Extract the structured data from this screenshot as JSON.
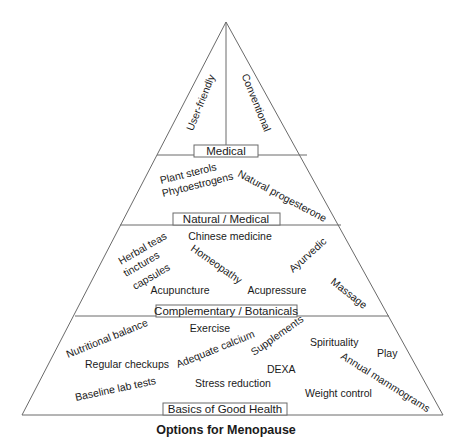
{
  "diagram": {
    "title": "Options for Menopause",
    "tiers": [
      {
        "name": "Medical",
        "items": [
          "User-friendly",
          "Conventional"
        ]
      },
      {
        "name": "Natural / Medical",
        "items": [
          "Plant sterols",
          "Phytoestrogens",
          "Natural progesterone"
        ]
      },
      {
        "name": "Complementary / Botanicals",
        "items": [
          "Chinese medicine",
          "Herbal teas",
          "tinctures",
          "capsules",
          "Homeopathy",
          "Ayurvedic",
          "Acupuncture",
          "Acupressure",
          "Massage"
        ]
      },
      {
        "name": "Basics of Good Health",
        "items": [
          "Nutritional balance",
          "Exercise",
          "Adequate calcium",
          "Supplements",
          "Spirituality",
          "Play",
          "Regular checkups",
          "DEXA",
          "Annual mammograms",
          "Baseline lab tests",
          "Stress reduction",
          "Weight control"
        ]
      }
    ]
  }
}
